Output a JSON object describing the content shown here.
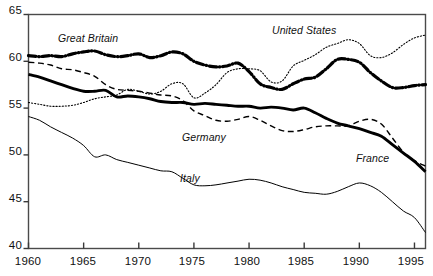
{
  "chart_data": {
    "type": "line",
    "title": "",
    "subtitle": "",
    "xlabel": "",
    "ylabel": "",
    "xlim": [
      1960,
      1996
    ],
    "ylim": [
      40,
      65
    ],
    "grid": false,
    "legend_position": "inline-annotations",
    "xticks": [
      1960,
      1965,
      1970,
      1975,
      1980,
      1985,
      1990,
      1995
    ],
    "xticklabels": [
      "1960",
      "1965",
      "1970",
      "1975",
      "1980",
      "1985",
      "1990",
      "1995"
    ],
    "yticks": [
      40,
      45,
      50,
      55,
      60,
      65
    ],
    "yticklabels": [
      "40",
      "45",
      "50",
      "55",
      "60",
      "65"
    ],
    "x": [
      1960,
      1961,
      1962,
      1963,
      1964,
      1965,
      1966,
      1967,
      1968,
      1969,
      1970,
      1971,
      1972,
      1973,
      1974,
      1975,
      1976,
      1977,
      1978,
      1979,
      1980,
      1981,
      1982,
      1983,
      1984,
      1985,
      1986,
      1987,
      1988,
      1989,
      1990,
      1991,
      1992,
      1993,
      1994,
      1995,
      1996
    ],
    "series": [
      {
        "name": "United States",
        "style": "dotted",
        "width": 1.1,
        "color": "#000000",
        "values": [
          55.6,
          55.4,
          55.2,
          55.2,
          55.3,
          55.6,
          56.0,
          56.2,
          56.4,
          57.0,
          56.8,
          56.5,
          56.8,
          57.6,
          57.6,
          56.1,
          56.6,
          57.5,
          58.8,
          59.2,
          59.2,
          59.0,
          57.8,
          57.9,
          59.5,
          60.1,
          60.7,
          61.5,
          61.9,
          62.3,
          61.9,
          60.6,
          60.4,
          60.9,
          61.8,
          62.5,
          62.8
        ]
      },
      {
        "name": "Great Britain",
        "style": "dashdot",
        "width": 3.2,
        "color": "#000000",
        "values": [
          60.6,
          60.5,
          60.6,
          60.5,
          60.8,
          61.0,
          61.1,
          60.7,
          60.5,
          60.6,
          60.8,
          60.4,
          60.6,
          61.0,
          60.8,
          60.0,
          59.6,
          59.4,
          59.5,
          59.8,
          58.9,
          57.6,
          57.2,
          57.0,
          57.6,
          58.1,
          58.3,
          59.2,
          60.2,
          60.2,
          59.9,
          58.8,
          57.9,
          57.2,
          57.2,
          57.4,
          57.5
        ]
      },
      {
        "name": "Germany",
        "style": "dashed",
        "width": 1.4,
        "color": "#000000",
        "values": [
          59.9,
          59.8,
          59.6,
          59.2,
          59.1,
          58.8,
          58.4,
          57.5,
          57.0,
          56.9,
          56.8,
          56.6,
          56.4,
          56.3,
          55.8,
          54.7,
          54.2,
          53.7,
          53.6,
          53.8,
          54.1,
          53.7,
          53.1,
          52.6,
          52.5,
          52.7,
          53.0,
          53.1,
          53.1,
          53.1,
          53.6,
          53.8,
          53.3,
          51.8,
          50.3,
          49.4,
          48.8
        ]
      },
      {
        "name": "France",
        "style": "solid",
        "width": 2.9,
        "color": "#000000",
        "values": [
          58.6,
          58.3,
          57.9,
          57.5,
          57.1,
          56.8,
          56.8,
          56.9,
          56.2,
          56.3,
          56.2,
          56.0,
          55.7,
          55.6,
          55.6,
          55.4,
          55.5,
          55.4,
          55.3,
          55.2,
          55.2,
          55.0,
          55.1,
          55.0,
          54.8,
          55.0,
          54.5,
          53.9,
          53.4,
          53.1,
          52.8,
          52.4,
          52.0,
          51.1,
          50.2,
          49.3,
          48.2
        ]
      },
      {
        "name": "Italy",
        "style": "solid",
        "width": 1.0,
        "color": "#000000",
        "values": [
          54.1,
          53.7,
          53.0,
          52.4,
          51.8,
          51.0,
          49.8,
          50.0,
          49.5,
          49.2,
          48.9,
          48.6,
          48.3,
          48.2,
          47.5,
          46.8,
          46.7,
          46.8,
          47.0,
          47.2,
          47.4,
          47.3,
          47.0,
          46.6,
          46.3,
          46.0,
          45.9,
          45.8,
          46.1,
          46.6,
          47.0,
          46.7,
          46.0,
          45.0,
          44.0,
          43.3,
          41.7
        ]
      }
    ],
    "annotations": [
      {
        "text": "Great Britain",
        "series": "Great Britain",
        "x_px": 58,
        "y_px": 32
      },
      {
        "text": "United States",
        "series": "United States",
        "x_px": 272,
        "y_px": 24
      },
      {
        "text": "Germany",
        "series": "Germany",
        "x_px": 182,
        "y_px": 131
      },
      {
        "text": "France",
        "series": "France",
        "x_px": 356,
        "y_px": 152
      },
      {
        "text": "Italy",
        "series": "Italy",
        "x_px": 180,
        "y_px": 172
      }
    ]
  },
  "axis": {
    "frame_color": "#4a4a4a",
    "tick_color": "#3a3a3a"
  }
}
